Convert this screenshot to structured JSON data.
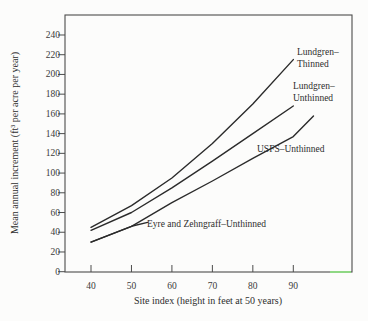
{
  "figure": {
    "background": "#fcfcfb",
    "line_color": "#2b2b2b",
    "frame_color": "#4c4c4c",
    "text_color": "#2e2e2e",
    "artifact_color": "#8ce87f"
  },
  "chart_data": {
    "type": "line",
    "title": "",
    "xlabel": "Site index (height in feet at 50 years)",
    "ylabel": "Mean annual increment (ft³ per acre per year)",
    "xticks": [
      40,
      50,
      60,
      70,
      80,
      90
    ],
    "yticks": [
      0,
      20,
      40,
      60,
      80,
      100,
      120,
      140,
      160,
      180,
      200,
      220,
      240
    ],
    "xlim": [
      33.5,
      104.5
    ],
    "ylim": [
      0,
      260
    ],
    "grid": false,
    "legend_position": "inline-annotations",
    "series": [
      {
        "name": "Lundgren–Thinned",
        "points": [
          [
            40,
            45
          ],
          [
            50,
            67
          ],
          [
            60,
            95
          ],
          [
            70,
            130
          ],
          [
            80,
            170
          ],
          [
            90,
            215
          ]
        ]
      },
      {
        "name": "Lundgren–Unthinned",
        "points": [
          [
            40,
            42
          ],
          [
            50,
            60
          ],
          [
            60,
            85
          ],
          [
            70,
            112
          ],
          [
            80,
            140
          ],
          [
            90,
            168
          ]
        ]
      },
      {
        "name": "USFS–Unthinned",
        "points": [
          [
            40,
            30
          ],
          [
            50,
            46
          ],
          [
            60,
            70
          ],
          [
            70,
            92
          ],
          [
            80,
            115
          ],
          [
            90,
            137
          ],
          [
            95,
            158
          ]
        ]
      },
      {
        "name": "Eyre and Zehngraff–Unthinned",
        "points": [
          [
            40,
            30
          ],
          [
            50,
            46
          ],
          [
            54,
            50
          ]
        ]
      }
    ]
  },
  "curve_labels": {
    "thinned_line1": "Lundgren–",
    "thinned_line2": "Thinned",
    "unthinned_line1": "Lundgren–",
    "unthinned_line2": "Unthinned",
    "usfs": "USFS–Unthinned",
    "eyre": "Eyre and Zehngraff–Unthinned"
  }
}
